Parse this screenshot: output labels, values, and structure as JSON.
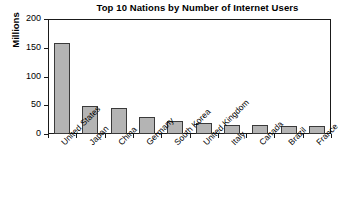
{
  "chart_data": {
    "type": "bar",
    "title": "Top 10 Nations by Number of Internet Users",
    "xlabel": "",
    "ylabel": "Millions",
    "categories": [
      "United States",
      "Japan",
      "China",
      "Germany",
      "South Korea",
      "United Kingdom",
      "Italy",
      "Canada",
      "Brazil",
      "France"
    ],
    "values": [
      158,
      48,
      45,
      30,
      23,
      19,
      16,
      15,
      14,
      14
    ],
    "ylim": [
      0,
      200
    ],
    "yticks": [
      0,
      50,
      100,
      150,
      200
    ],
    "ytick_labels": [
      "0",
      "50",
      "100",
      "150",
      "200"
    ],
    "grid": false,
    "legend": null,
    "bar_color": "#b4b4b4",
    "bar_border_color": "#3a3a3a",
    "axis_color": "#1a1a1a",
    "background": "#ffffff"
  }
}
